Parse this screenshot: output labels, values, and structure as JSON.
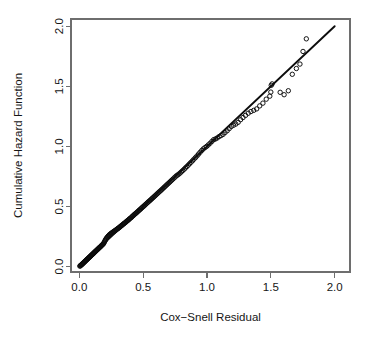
{
  "chart_data": {
    "type": "scatter",
    "title": "",
    "subtitle": "",
    "xlabel": "Cox−Snell Residual",
    "ylabel": "Cumulative Hazard Function",
    "xlim": [
      -0.065,
      2.12
    ],
    "ylim": [
      -0.045,
      2.06
    ],
    "xticks": [
      0.0,
      0.5,
      1.0,
      1.5,
      2.0
    ],
    "xticklabels": [
      "0.0",
      "0.5",
      "1.0",
      "1.5",
      "2.0"
    ],
    "yticks": [
      0.0,
      0.5,
      1.0,
      1.5,
      2.0
    ],
    "yticklabels": [
      "0.0",
      "0.5",
      "1.0",
      "1.5",
      "2.0"
    ],
    "grid": false,
    "legend": null,
    "legend_position": "none",
    "marker": "open-circle",
    "marker_size_px": 4.4,
    "point_color": "#0a0a0a",
    "line_color": "#0d0d0d",
    "box_color": "#6e6e6e",
    "background": "#ffffff",
    "annotations": [],
    "reference_line": {
      "label": "identity line",
      "slope": 1.0,
      "intercept": 0.0,
      "x_start": 0.0,
      "y_start": 0.0,
      "x_end": 2.0,
      "y_end": 2.0
    },
    "series": [
      {
        "name": "Cox-Snell residuals vs Nelson-Aalen cumulative hazard",
        "points": [
          [
            0.004,
            0.004
          ],
          [
            0.008,
            0.006
          ],
          [
            0.011,
            0.01
          ],
          [
            0.014,
            0.013
          ],
          [
            0.018,
            0.016
          ],
          [
            0.021,
            0.019
          ],
          [
            0.024,
            0.022
          ],
          [
            0.027,
            0.026
          ],
          [
            0.031,
            0.029
          ],
          [
            0.034,
            0.032
          ],
          [
            0.037,
            0.036
          ],
          [
            0.04,
            0.039
          ],
          [
            0.044,
            0.042
          ],
          [
            0.047,
            0.046
          ],
          [
            0.05,
            0.049
          ],
          [
            0.053,
            0.052
          ],
          [
            0.057,
            0.056
          ],
          [
            0.06,
            0.059
          ],
          [
            0.063,
            0.062
          ],
          [
            0.067,
            0.066
          ],
          [
            0.07,
            0.069
          ],
          [
            0.073,
            0.073
          ],
          [
            0.077,
            0.076
          ],
          [
            0.08,
            0.079
          ],
          [
            0.084,
            0.083
          ],
          [
            0.087,
            0.086
          ],
          [
            0.09,
            0.09
          ],
          [
            0.094,
            0.093
          ],
          [
            0.097,
            0.097
          ],
          [
            0.101,
            0.1
          ],
          [
            0.104,
            0.104
          ],
          [
            0.108,
            0.107
          ],
          [
            0.111,
            0.111
          ],
          [
            0.115,
            0.114
          ],
          [
            0.118,
            0.118
          ],
          [
            0.122,
            0.122
          ],
          [
            0.125,
            0.125
          ],
          [
            0.129,
            0.129
          ],
          [
            0.132,
            0.132
          ],
          [
            0.136,
            0.136
          ],
          [
            0.14,
            0.14
          ],
          [
            0.143,
            0.143
          ],
          [
            0.147,
            0.147
          ],
          [
            0.151,
            0.151
          ],
          [
            0.154,
            0.155
          ],
          [
            0.158,
            0.158
          ],
          [
            0.162,
            0.162
          ],
          [
            0.166,
            0.166
          ],
          [
            0.17,
            0.17
          ],
          [
            0.173,
            0.174
          ],
          [
            0.177,
            0.178
          ],
          [
            0.181,
            0.182
          ],
          [
            0.185,
            0.186
          ],
          [
            0.189,
            0.19
          ],
          [
            0.193,
            0.197
          ],
          [
            0.197,
            0.206
          ],
          [
            0.201,
            0.214
          ],
          [
            0.205,
            0.222
          ],
          [
            0.209,
            0.23
          ],
          [
            0.213,
            0.236
          ],
          [
            0.218,
            0.242
          ],
          [
            0.222,
            0.248
          ],
          [
            0.226,
            0.253
          ],
          [
            0.23,
            0.258
          ],
          [
            0.235,
            0.263
          ],
          [
            0.239,
            0.267
          ],
          [
            0.244,
            0.271
          ],
          [
            0.248,
            0.275
          ],
          [
            0.253,
            0.279
          ],
          [
            0.257,
            0.282
          ],
          [
            0.262,
            0.286
          ],
          [
            0.267,
            0.289
          ],
          [
            0.271,
            0.293
          ],
          [
            0.276,
            0.296
          ],
          [
            0.281,
            0.3
          ],
          [
            0.286,
            0.304
          ],
          [
            0.291,
            0.308
          ],
          [
            0.296,
            0.312
          ],
          [
            0.301,
            0.316
          ],
          [
            0.306,
            0.32
          ],
          [
            0.311,
            0.324
          ],
          [
            0.316,
            0.328
          ],
          [
            0.321,
            0.333
          ],
          [
            0.326,
            0.337
          ],
          [
            0.331,
            0.342
          ],
          [
            0.337,
            0.346
          ],
          [
            0.342,
            0.351
          ],
          [
            0.347,
            0.356
          ],
          [
            0.353,
            0.36
          ],
          [
            0.358,
            0.365
          ],
          [
            0.364,
            0.37
          ],
          [
            0.369,
            0.375
          ],
          [
            0.375,
            0.38
          ],
          [
            0.381,
            0.385
          ],
          [
            0.386,
            0.39
          ],
          [
            0.392,
            0.396
          ],
          [
            0.398,
            0.401
          ],
          [
            0.404,
            0.406
          ],
          [
            0.41,
            0.412
          ],
          [
            0.416,
            0.418
          ],
          [
            0.422,
            0.424
          ],
          [
            0.428,
            0.43
          ],
          [
            0.434,
            0.436
          ],
          [
            0.44,
            0.441
          ],
          [
            0.447,
            0.447
          ],
          [
            0.453,
            0.453
          ],
          [
            0.459,
            0.459
          ],
          [
            0.466,
            0.466
          ],
          [
            0.472,
            0.472
          ],
          [
            0.479,
            0.478
          ],
          [
            0.486,
            0.485
          ],
          [
            0.492,
            0.491
          ],
          [
            0.499,
            0.498
          ],
          [
            0.506,
            0.504
          ],
          [
            0.513,
            0.511
          ],
          [
            0.52,
            0.518
          ],
          [
            0.527,
            0.525
          ],
          [
            0.534,
            0.532
          ],
          [
            0.541,
            0.539
          ],
          [
            0.549,
            0.546
          ],
          [
            0.556,
            0.553
          ],
          [
            0.564,
            0.56
          ],
          [
            0.571,
            0.568
          ],
          [
            0.579,
            0.575
          ],
          [
            0.587,
            0.583
          ],
          [
            0.594,
            0.59
          ],
          [
            0.602,
            0.598
          ],
          [
            0.61,
            0.606
          ],
          [
            0.618,
            0.614
          ],
          [
            0.626,
            0.622
          ],
          [
            0.635,
            0.63
          ],
          [
            0.643,
            0.638
          ],
          [
            0.651,
            0.646
          ],
          [
            0.66,
            0.655
          ],
          [
            0.668,
            0.663
          ],
          [
            0.677,
            0.672
          ],
          [
            0.686,
            0.681
          ],
          [
            0.695,
            0.69
          ],
          [
            0.704,
            0.699
          ],
          [
            0.713,
            0.708
          ],
          [
            0.722,
            0.717
          ],
          [
            0.731,
            0.726
          ],
          [
            0.741,
            0.736
          ],
          [
            0.75,
            0.745
          ],
          [
            0.76,
            0.755
          ],
          [
            0.77,
            0.762
          ],
          [
            0.78,
            0.77
          ],
          [
            0.79,
            0.779
          ],
          [
            0.8,
            0.789
          ],
          [
            0.81,
            0.799
          ],
          [
            0.821,
            0.81
          ],
          [
            0.831,
            0.821
          ],
          [
            0.842,
            0.832
          ],
          [
            0.853,
            0.844
          ],
          [
            0.864,
            0.856
          ],
          [
            0.875,
            0.868
          ],
          [
            0.887,
            0.881
          ],
          [
            0.898,
            0.894
          ],
          [
            0.91,
            0.907
          ],
          [
            0.922,
            0.921
          ],
          [
            0.934,
            0.936
          ],
          [
            0.946,
            0.951
          ],
          [
            0.959,
            0.966
          ],
          [
            0.971,
            0.979
          ],
          [
            0.984,
            0.99
          ],
          [
            0.997,
            1.0
          ],
          [
            1.01,
            1.012
          ],
          [
            1.024,
            1.026
          ],
          [
            1.038,
            1.041
          ],
          [
            1.052,
            1.056
          ],
          [
            1.066,
            1.062
          ],
          [
            1.08,
            1.07
          ],
          [
            1.095,
            1.082
          ],
          [
            1.11,
            1.09
          ],
          [
            1.126,
            1.1
          ],
          [
            1.141,
            1.115
          ],
          [
            1.158,
            1.13
          ],
          [
            1.174,
            1.148
          ],
          [
            1.191,
            1.166
          ],
          [
            1.208,
            1.176
          ],
          [
            1.226,
            1.186
          ],
          [
            1.244,
            1.2
          ],
          [
            1.263,
            1.222
          ],
          [
            1.282,
            1.24
          ],
          [
            1.302,
            1.258
          ],
          [
            1.323,
            1.276
          ],
          [
            1.344,
            1.29
          ],
          [
            1.366,
            1.3
          ],
          [
            1.389,
            1.312
          ],
          [
            1.413,
            1.337
          ],
          [
            1.438,
            1.36
          ],
          [
            1.464,
            1.393
          ],
          [
            1.492,
            1.418
          ],
          [
            1.5,
            1.452
          ],
          [
            1.503,
            1.508
          ],
          [
            1.51,
            1.52
          ],
          [
            1.573,
            1.45
          ],
          [
            1.604,
            1.43
          ],
          [
            1.637,
            1.463
          ],
          [
            1.668,
            1.6
          ],
          [
            1.7,
            1.648
          ],
          [
            1.728,
            1.685
          ],
          [
            1.752,
            1.79
          ],
          [
            1.778,
            1.895
          ]
        ]
      }
    ]
  },
  "axis": {
    "x_title": "Cox−Snell Residual",
    "y_title": "Cumulative Hazard Function"
  }
}
